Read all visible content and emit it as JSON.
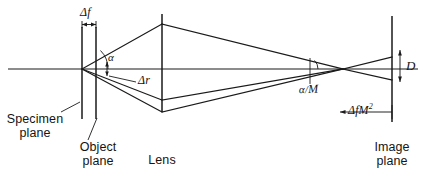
{
  "figure": {
    "kind": "optical-ray-diagram",
    "background_color": "#ffffff",
    "ink_color": "#1a1a1a",
    "width": 426,
    "height": 181
  },
  "labels": {
    "delta_f": "Δf",
    "delta_r": "Δr",
    "alpha": "α",
    "alpha_over_m_num": "α",
    "alpha_over_m_slash": "/",
    "alpha_over_m_den": "M",
    "aperture_d": "D",
    "delta_f_m_squared_prefix": "Δf",
    "delta_f_m_squared_base": "M",
    "delta_f_m_squared_exp": "2",
    "specimen_plane_line1": "Specimen",
    "specimen_plane_line2": "plane",
    "object_plane_line1": "Object",
    "object_plane_line2": "plane",
    "lens": "Lens",
    "image_plane_line1": "Image",
    "image_plane_line2": "plane"
  },
  "geometry": {
    "optical_axis_y": 69,
    "axis_x_start": 8,
    "axis_x_end": 418,
    "specimen_plane_x": 82,
    "specimen_plane_y_top": 27,
    "specimen_plane_y_bottom": 119,
    "object_plane_x": 96,
    "object_plane_y_top": 27,
    "object_plane_y_bottom": 119,
    "lens_x": 162,
    "lens_y_top": 14,
    "lens_y_bottom": 112,
    "image_plane_x": 392,
    "image_plane_y_top": 16,
    "image_plane_y_bottom": 122,
    "source_point_x": 82,
    "source_point_y": 69,
    "lens_upper_ray_y": 24,
    "lens_lower_ray_y": 100,
    "focus_x": 343,
    "focus_y": 69,
    "image_spot_top_y": 57,
    "image_spot_bottom_y": 80,
    "delta_f_tick_left_x": 82,
    "delta_f_tick_right_x": 96,
    "delta_f_tick_y": 24,
    "delta_r_arrow_x": 107,
    "delta_r_arrow_top_y": 62,
    "delta_r_arrow_bottom_y": 75,
    "alpha_arc_center_x": 82,
    "alpha_arc_radius": 26,
    "alpha_over_m_arc_x": 310,
    "aperture_d_x": 400,
    "aperture_d_top_y": 50,
    "aperture_d_bottom_y": 80,
    "delta_f_m2_arrow_left_x": 340,
    "delta_f_m2_arrow_right_x": 392,
    "delta_f_m2_arrow_y": 112
  }
}
